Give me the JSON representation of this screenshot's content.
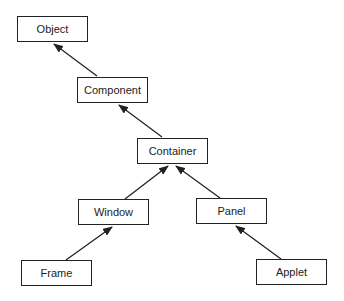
{
  "diagram": {
    "title": "",
    "type": "class-hierarchy",
    "nodes": [
      {
        "id": "object",
        "label": "Object"
      },
      {
        "id": "component",
        "label": "Component"
      },
      {
        "id": "container",
        "label": "Container"
      },
      {
        "id": "window",
        "label": "Window"
      },
      {
        "id": "panel",
        "label": "Panel"
      },
      {
        "id": "frame",
        "label": "Frame"
      },
      {
        "id": "applet",
        "label": "Applet"
      }
    ],
    "edges": [
      {
        "from": "Component",
        "to": "Object"
      },
      {
        "from": "Container",
        "to": "Component"
      },
      {
        "from": "Window",
        "to": "Container"
      },
      {
        "from": "Panel",
        "to": "Container"
      },
      {
        "from": "Frame",
        "to": "Window"
      },
      {
        "from": "Applet",
        "to": "Panel"
      }
    ],
    "colors": {
      "stroke": "#222222",
      "background": "#ffffff"
    }
  }
}
